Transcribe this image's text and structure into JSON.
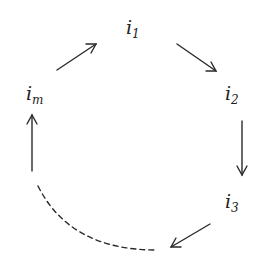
{
  "diagram": {
    "type": "cycle",
    "nodes": [
      {
        "id": "i1",
        "base": "i",
        "sub": "1",
        "x": 126,
        "y": 18
      },
      {
        "id": "i2",
        "base": "i",
        "sub": "2",
        "x": 225,
        "y": 84
      },
      {
        "id": "i3",
        "base": "i",
        "sub": "3",
        "x": 225,
        "y": 192
      },
      {
        "id": "im",
        "base": "i",
        "sub": "m",
        "x": 26,
        "y": 84
      }
    ],
    "edges": [
      {
        "from": "im",
        "to": "i1",
        "style": "solid",
        "arrow": true
      },
      {
        "from": "i1",
        "to": "i2",
        "style": "solid",
        "arrow": true
      },
      {
        "from": "i2",
        "to": "i3",
        "style": "solid",
        "arrow": true
      },
      {
        "from": "i3",
        "to": "...",
        "style": "solid",
        "arrow": true
      },
      {
        "from": "...",
        "to": "...",
        "style": "dashed",
        "arrow": false
      },
      {
        "from": "...",
        "to": "im",
        "style": "solid",
        "arrow": true
      }
    ],
    "stroke_color": "#2a2a2a"
  }
}
